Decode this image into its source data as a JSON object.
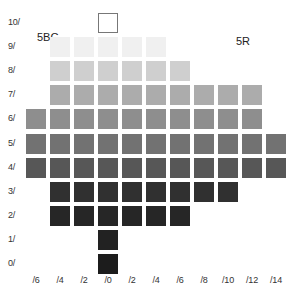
{
  "chart_data": {
    "type": "heatmap",
    "hue_left": "5BG",
    "hue_right": "5R",
    "ylabel": "Value",
    "xlabel": "Chroma",
    "y_ticks": [
      "10/",
      "9/",
      "8/",
      "7/",
      "6/",
      "5/",
      "4/",
      "3/",
      "2/",
      "1/",
      "0/"
    ],
    "x_ticks": [
      "/6",
      "/4",
      "/2",
      "/0",
      "/2",
      "/4",
      "/6",
      "/8",
      "/10",
      "/12",
      "/14"
    ],
    "x_side": [
      "BG",
      "BG",
      "BG",
      "N",
      "R",
      "R",
      "R",
      "R",
      "R",
      "R",
      "R"
    ],
    "rows": [
      {
        "value": 10,
        "cols": [
          3
        ],
        "gray": "#ffffff",
        "outlined": true
      },
      {
        "value": 9,
        "cols": [
          1,
          2,
          3,
          4,
          5
        ],
        "gray": "#f0f0f0"
      },
      {
        "value": 8,
        "cols": [
          1,
          2,
          3,
          4,
          5,
          6
        ],
        "gray": "#cfcfcf"
      },
      {
        "value": 7,
        "cols": [
          1,
          2,
          3,
          4,
          5,
          6,
          7,
          8,
          9
        ],
        "gray": "#acacac"
      },
      {
        "value": 6,
        "cols": [
          0,
          1,
          2,
          3,
          4,
          5,
          6,
          7,
          8,
          9
        ],
        "gray": "#8e8e8e"
      },
      {
        "value": 5,
        "cols": [
          0,
          1,
          2,
          3,
          4,
          5,
          6,
          7,
          8,
          9,
          10
        ],
        "gray": "#727272"
      },
      {
        "value": 4,
        "cols": [
          0,
          1,
          2,
          3,
          4,
          5,
          6,
          7,
          8,
          9,
          10
        ],
        "gray": "#575757"
      },
      {
        "value": 3,
        "cols": [
          1,
          2,
          3,
          4,
          5,
          6,
          7,
          8
        ],
        "gray": "#303030"
      },
      {
        "value": 2,
        "cols": [
          1,
          2,
          3,
          4,
          5,
          6
        ],
        "gray": "#262626"
      },
      {
        "value": 1,
        "cols": [
          3
        ],
        "gray": "#222222"
      },
      {
        "value": 0,
        "cols": [
          3
        ],
        "gray": "#1c1c1c"
      }
    ],
    "grid": false,
    "legend": "none"
  },
  "labels": {
    "hue_left": "5BG",
    "hue_right": "5R"
  }
}
